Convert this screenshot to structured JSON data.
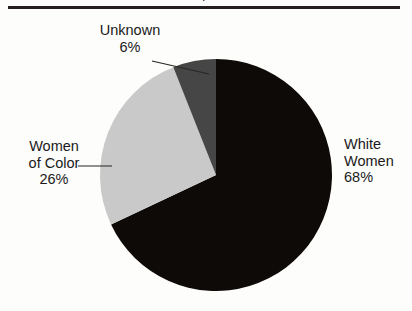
{
  "figure": {
    "clipped_title": "p",
    "background_color": "#fdfdfb",
    "rule_color": "#241f1c"
  },
  "labels": {
    "unknown": {
      "name": "Unknown",
      "value": "6%"
    },
    "women_of_color": {
      "name_line1": "Women",
      "name_line2": "of Color",
      "value": "26%"
    },
    "white_women": {
      "name_line1": "White",
      "name_line2": "Women",
      "value": "68%"
    }
  },
  "chart_data": {
    "type": "pie",
    "title": "",
    "categories": [
      "White Women",
      "Women of Color",
      "Unknown"
    ],
    "values": [
      68,
      26,
      6
    ],
    "value_labels": [
      "68%",
      "26%",
      "6%"
    ],
    "colors": [
      "#0d0a08",
      "#c9c9c9",
      "#464646"
    ],
    "start_angle_deg": 0,
    "direction": "clockwise",
    "units": "percent",
    "total": 100,
    "legend": "none",
    "grid": false,
    "center": {
      "cx": 216,
      "cy": 175
    },
    "radius": 116,
    "leader_lines": [
      {
        "for": "Unknown",
        "from_x": 152,
        "from_y": 61,
        "to_x": 209,
        "to_y": 74
      },
      {
        "for": "Women of Color",
        "from_x": 78,
        "from_y": 166,
        "to_x": 112,
        "to_y": 166
      }
    ]
  }
}
